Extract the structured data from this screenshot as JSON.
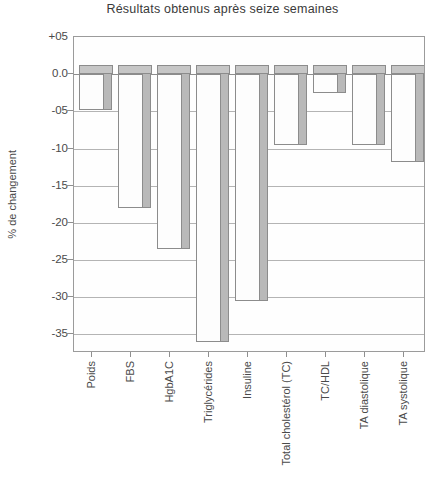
{
  "chart_data": {
    "type": "bar",
    "title": "Résultats obtenus après seize semaines",
    "xlabel": "",
    "ylabel": "% de changement",
    "ylim": [
      -37.5,
      5
    ],
    "grid": true,
    "legend": "none",
    "orientation": "vertical",
    "style": "3d-bar",
    "ytick_labels": [
      "+05",
      "0.0",
      "-05",
      "-10",
      "-15",
      "-20",
      "-25",
      "-30",
      "-35"
    ],
    "ytick_values": [
      5,
      0,
      -5,
      -10,
      -15,
      -20,
      -25,
      -30,
      -35
    ],
    "categories": [
      "Poids",
      "FBS",
      "HgbA1C",
      "Triglycérides",
      "Insuline",
      "Total cholestérol (TC)",
      "TC/HDL",
      "TA diastolique",
      "TA systolique"
    ],
    "values": [
      -4.8,
      -18.0,
      -23.5,
      -36.0,
      -30.5,
      -9.5,
      -2.5,
      -9.5,
      -11.8
    ],
    "colors": {
      "bar_front": "#fdfdfd",
      "bar_side": "#b9b9b9",
      "bar_top": "#c6c6c6",
      "bar_outline": "#8c8c8c",
      "gridline": "#b4b4b4",
      "axis": "#9b9b9b",
      "text": "#4a4a4a",
      "background": "#ffffff"
    }
  }
}
